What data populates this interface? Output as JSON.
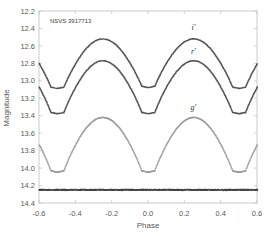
{
  "chart_data": {
    "type": "scatter",
    "title": "",
    "annotation": "NSVS 3917713",
    "xlabel": "Phase",
    "ylabel": "Magnitude",
    "xlim": [
      -0.6,
      0.6
    ],
    "ylim": [
      14.4,
      12.2
    ],
    "y_inverted": true,
    "grid": false,
    "legend": "inline labels",
    "xticks": [
      "-0.6",
      "-0.4",
      "-0.2",
      "0.0",
      "0.2",
      "0.4",
      "0.6"
    ],
    "yticks": [
      "12.2",
      "12.4",
      "12.6",
      "12.8",
      "13.0",
      "13.2",
      "13.4",
      "13.6",
      "13.8",
      "14.0",
      "14.2",
      "14.4"
    ],
    "series": [
      {
        "name": "i'",
        "label": "i'",
        "label_pos": [
          0.25,
          12.42
        ],
        "max_mag": 12.52,
        "primary_min_mag": 13.07,
        "secondary_min_mag": 13.08,
        "min_halfwidth": 0.035,
        "color": "#404040"
      },
      {
        "name": "r'",
        "label": "r'",
        "label_pos": [
          0.25,
          12.69
        ],
        "max_mag": 12.77,
        "primary_min_mag": 13.37,
        "secondary_min_mag": 13.37,
        "min_halfwidth": 0.035,
        "color": "#404040"
      },
      {
        "name": "g'",
        "label": "g'",
        "label_pos": [
          0.25,
          13.34
        ],
        "max_mag": 13.42,
        "primary_min_mag": 14.04,
        "secondary_min_mag": 14.04,
        "min_halfwidth": 0.035,
        "color": "#9a9a9a"
      },
      {
        "name": "comparison",
        "label": "",
        "constant_mag": 14.25,
        "color": "#303030"
      }
    ]
  }
}
